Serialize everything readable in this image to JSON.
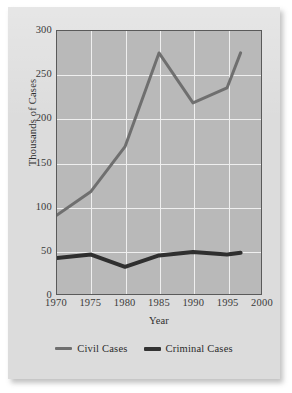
{
  "chart_data": {
    "type": "line",
    "title": "",
    "xlabel": "Year",
    "ylabel": "Thousands of Cases",
    "xlim": [
      1970,
      2000
    ],
    "ylim": [
      0,
      300
    ],
    "grid": true,
    "legend_position": "bottom",
    "xticks": [
      1970,
      1975,
      1980,
      1985,
      1990,
      1995,
      2000
    ],
    "xtick_labels": [
      "1970",
      "1975",
      "1980",
      "1985",
      "1990",
      "1995",
      "2000"
    ],
    "yticks": [
      0,
      50,
      100,
      150,
      200,
      250,
      300
    ],
    "ytick_labels": [
      "0",
      "50",
      "100",
      "150",
      "200",
      "250",
      "300"
    ],
    "series": [
      {
        "name": "Civil Cases",
        "color": "#6f6f6f",
        "line_width": 3,
        "x": [
          1970,
          1975,
          1980,
          1985,
          1990,
          1995,
          1997
        ],
        "values": [
          90,
          117,
          168,
          275,
          218,
          235,
          275
        ]
      },
      {
        "name": "Criminal Cases",
        "color": "#2f2f2f",
        "line_width": 4,
        "x": [
          1970,
          1975,
          1980,
          1985,
          1990,
          1995,
          1997
        ],
        "values": [
          41,
          45,
          31,
          44,
          48,
          45,
          47
        ]
      }
    ]
  },
  "axes": {
    "y_title": "Thousands of Cases",
    "x_title": "Year"
  },
  "legend": {
    "entries": [
      {
        "label": "Civil Cases",
        "swatch": "civil-line-swatch"
      },
      {
        "label": "Criminal Cases",
        "swatch": "criminal-line-swatch"
      }
    ]
  },
  "colors": {
    "plot_background": "#b9b9b9",
    "page_background": "#dcdcdc",
    "gridline": "#efefef",
    "axis_border": "#5a5a5a",
    "civil_series": "#6f6f6f",
    "criminal_series": "#2f2f2f",
    "text": "#2f2f2f"
  }
}
